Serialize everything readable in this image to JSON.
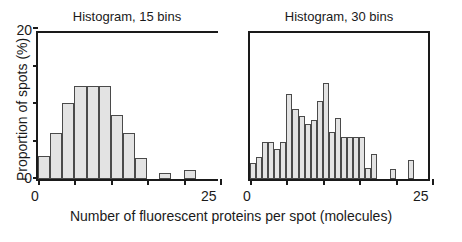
{
  "figure": {
    "xlabel": "Number of fluorescent proteins per spot (molecules)",
    "ylabel": "Proportion of spots (%)"
  },
  "chart_data": [
    {
      "type": "bar",
      "title": "Histogram, 15 bins",
      "xlabel": "Number of fluorescent proteins per spot (molecules)",
      "ylabel": "Proportion of spots (%)",
      "xlim": [
        0,
        25
      ],
      "ylim": [
        0,
        20
      ],
      "xticks": [
        0,
        5,
        10,
        15,
        20,
        25
      ],
      "xticklabels": [
        "0",
        "",
        "",
        "",
        "",
        "25"
      ],
      "yticks": [
        0,
        5,
        10,
        15,
        20
      ],
      "yticklabels": [
        "0",
        "",
        "",
        "",
        "20"
      ],
      "grid": false,
      "legend": null,
      "bin_width": 1.6667,
      "bin_edges": [
        0,
        1.667,
        3.333,
        5.0,
        6.667,
        8.333,
        10.0,
        11.667,
        13.333,
        15.0,
        16.667,
        18.333,
        20.0,
        21.667,
        23.333,
        25.0
      ],
      "bin_centers": [
        0.83,
        2.5,
        4.17,
        5.83,
        7.5,
        9.17,
        10.83,
        12.5,
        14.17,
        15.83,
        17.5,
        19.17,
        20.83,
        22.5,
        24.17
      ],
      "values": [
        3.1,
        6.2,
        10.1,
        12.4,
        12.4,
        12.4,
        8.5,
        6.2,
        2.8,
        0,
        0.8,
        0,
        1.2,
        0,
        0
      ]
    },
    {
      "type": "bar",
      "title": "Histogram, 30 bins",
      "xlabel": "Number of fluorescent proteins per spot (molecules)",
      "ylabel": "Proportion of spots (%)",
      "xlim": [
        0,
        25
      ],
      "ylim": [
        0,
        20
      ],
      "xticks": [
        0,
        5,
        10,
        15,
        20,
        25
      ],
      "xticklabels": [
        "0",
        "",
        "",
        "",
        "",
        "25"
      ],
      "yticks": [
        0,
        5,
        10,
        15,
        20
      ],
      "yticklabels": [
        "0",
        "",
        "",
        "",
        "20"
      ],
      "grid": false,
      "legend": null,
      "bin_width": 0.8333,
      "bin_edges": [
        0,
        0.833,
        1.667,
        2.5,
        3.333,
        4.167,
        5.0,
        5.833,
        6.667,
        7.5,
        8.333,
        9.167,
        10.0,
        10.833,
        11.667,
        12.5,
        13.333,
        14.167,
        15.0,
        15.833,
        16.667,
        17.5,
        18.333,
        19.167,
        20.0,
        20.833,
        21.667,
        22.5,
        23.333,
        24.167,
        25.0
      ],
      "bin_centers": [
        0.42,
        1.25,
        2.08,
        2.92,
        3.75,
        4.58,
        5.42,
        6.25,
        7.08,
        7.92,
        8.75,
        9.58,
        10.42,
        11.25,
        12.08,
        12.92,
        13.75,
        14.58,
        15.42,
        16.25,
        17.08,
        17.92,
        18.75,
        19.58,
        20.42,
        21.25,
        22.08,
        22.92,
        23.75,
        24.58
      ],
      "values": [
        2.1,
        3.0,
        5.0,
        5.0,
        4.0,
        5.0,
        11.4,
        9.3,
        8.4,
        7.4,
        7.9,
        10.4,
        12.8,
        6.3,
        8.2,
        5.6,
        5.6,
        5.6,
        5.6,
        1.5,
        3.3,
        0,
        0,
        1.4,
        0,
        0,
        2.5,
        0,
        0,
        0
      ]
    }
  ]
}
